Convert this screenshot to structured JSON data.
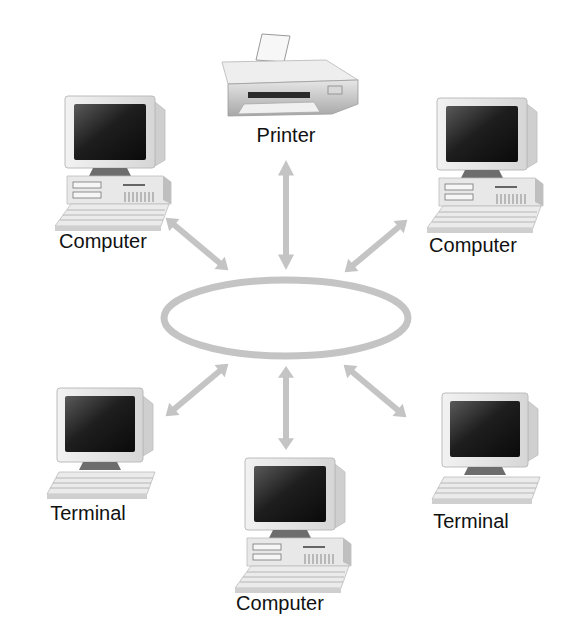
{
  "diagram": {
    "type": "ring-network",
    "colors": {
      "ring": "#c4c4c4",
      "arrow": "#c4c4c4",
      "text": "#111111",
      "background": "#ffffff"
    },
    "ring": {
      "cx": 286,
      "cy": 318,
      "rx": 122,
      "ry": 38
    },
    "nodes": [
      {
        "id": "printer",
        "label": "Printer",
        "kind": "printer",
        "label_x": 286,
        "label_y": 124
      },
      {
        "id": "computer-top-left",
        "label": "Computer",
        "kind": "computer",
        "label_x": 103,
        "label_y": 230
      },
      {
        "id": "computer-top-right",
        "label": "Computer",
        "kind": "computer",
        "label_x": 473,
        "label_y": 234
      },
      {
        "id": "terminal-bottom-left",
        "label": "Terminal",
        "kind": "terminal",
        "label_x": 88,
        "label_y": 502
      },
      {
        "id": "computer-bottom",
        "label": "Computer",
        "kind": "computer",
        "label_x": 280,
        "label_y": 592
      },
      {
        "id": "terminal-bottom-right",
        "label": "Terminal",
        "kind": "terminal",
        "label_x": 471,
        "label_y": 510
      }
    ],
    "links": [
      {
        "from": "ring",
        "to": "printer",
        "bidirectional": true
      },
      {
        "from": "ring",
        "to": "computer-top-left",
        "bidirectional": true
      },
      {
        "from": "ring",
        "to": "computer-top-right",
        "bidirectional": true
      },
      {
        "from": "ring",
        "to": "terminal-bottom-left",
        "bidirectional": true
      },
      {
        "from": "ring",
        "to": "computer-bottom",
        "bidirectional": true
      },
      {
        "from": "ring",
        "to": "terminal-bottom-right",
        "bidirectional": true
      }
    ]
  }
}
